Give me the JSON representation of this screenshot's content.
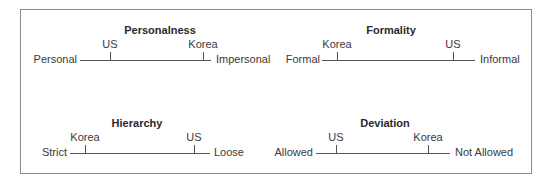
{
  "figure": {
    "border_color": "#8a8a8a",
    "line_color": "#555555",
    "panels": [
      {
        "title": "Personalness",
        "left_pole": "Personal",
        "right_pole": "Impersonal",
        "markers": [
          {
            "label": "US",
            "position": 0.23
          },
          {
            "label": "Korea",
            "position": 0.94
          }
        ]
      },
      {
        "title": "Formality",
        "left_pole": "Formal",
        "right_pole": "Informal",
        "markers": [
          {
            "label": "Korea",
            "position": 0.1
          },
          {
            "label": "US",
            "position": 0.86
          }
        ]
      },
      {
        "title": "Hierarchy",
        "left_pole": "Strict",
        "right_pole": "Loose",
        "markers": [
          {
            "label": "Korea",
            "position": 0.11
          },
          {
            "label": "US",
            "position": 0.89
          }
        ]
      },
      {
        "title": "Deviation",
        "left_pole": "Allowed",
        "right_pole": "Not Allowed",
        "markers": [
          {
            "label": "US",
            "position": 0.15
          },
          {
            "label": "Korea",
            "position": 0.84
          }
        ]
      }
    ]
  }
}
